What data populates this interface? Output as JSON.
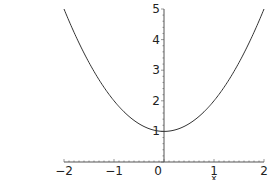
{
  "chart_data": {
    "type": "line",
    "title": "",
    "xlabel": "x",
    "ylabel": "",
    "xlim": [
      -2,
      2
    ],
    "ylim": [
      0,
      5
    ],
    "x_ticks": [
      -2,
      -1,
      0,
      1,
      2
    ],
    "x_tick_labels": [
      "−2",
      "−1",
      "0",
      "1",
      "2"
    ],
    "y_ticks": [
      1,
      2,
      3,
      4,
      5
    ],
    "y_tick_labels": [
      "1",
      "2",
      "3",
      "4",
      "5"
    ],
    "grid": false,
    "legend": null,
    "series": [
      {
        "name": "x^2 + 1",
        "color": "#333333",
        "x": [
          -2,
          -1.75,
          -1.5,
          -1.25,
          -1,
          -0.75,
          -0.5,
          -0.25,
          0,
          0.25,
          0.5,
          0.75,
          1,
          1.25,
          1.5,
          1.75,
          2
        ],
        "y": [
          5,
          4.0625,
          3.25,
          2.5625,
          2,
          1.5625,
          1.25,
          1.0625,
          1,
          1.0625,
          1.25,
          1.5625,
          2,
          2.5625,
          3.25,
          4.0625,
          5
        ]
      }
    ]
  },
  "layout": {
    "x_origin_px": 164,
    "y_origin_px": 162,
    "px_per_x_unit": 50,
    "px_per_y_unit": 30.6
  }
}
